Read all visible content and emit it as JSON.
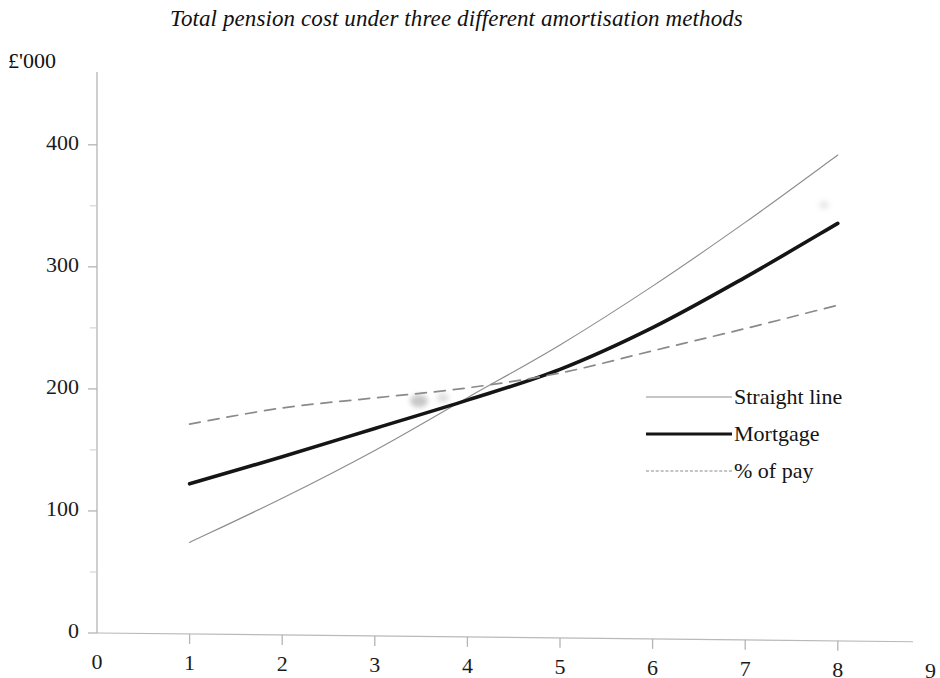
{
  "chart_data": {
    "type": "line",
    "title": "Total pension cost under three different amortisation methods",
    "ylabel": "£'000",
    "xlabel": "",
    "xlim": [
      0,
      9
    ],
    "ylim": [
      0,
      440
    ],
    "grid": false,
    "legend_position": "right-middle",
    "y_ticks": [
      "0",
      "100",
      "200",
      "300",
      "400"
    ],
    "y_tick_values": [
      0,
      100,
      200,
      300,
      400
    ],
    "y_minor_tick_values": [
      50,
      150,
      250,
      350
    ],
    "x_ticks": [
      "0",
      "1",
      "2",
      "3",
      "4",
      "5",
      "6",
      "7",
      "8",
      "9"
    ],
    "x_tick_values": [
      0,
      1,
      2,
      3,
      4,
      5,
      6,
      7,
      8,
      9
    ],
    "x": [
      1,
      2,
      3,
      4,
      5,
      6,
      7,
      8
    ],
    "series": [
      {
        "name": "Straight line",
        "style": "thin-solid",
        "color": "#8d8d8d",
        "values": [
          75,
          112,
          152,
          196,
          240,
          289,
          342,
          398
        ]
      },
      {
        "name": "Mortgage",
        "style": "thick-solid",
        "color": "#151515",
        "values": [
          123,
          146,
          170,
          194,
          220,
          255,
          297,
          342
        ]
      },
      {
        "name": "% of pay",
        "style": "dashed",
        "color": "#8a8a8a",
        "values": [
          172,
          186,
          195,
          204,
          217,
          236,
          255,
          275
        ]
      }
    ],
    "crossover_note": "All three series intersect near x = 5, y = 220"
  },
  "legend": {
    "items": [
      {
        "label": "Straight line"
      },
      {
        "label": "Mortgage"
      },
      {
        "label": "% of pay"
      }
    ]
  }
}
